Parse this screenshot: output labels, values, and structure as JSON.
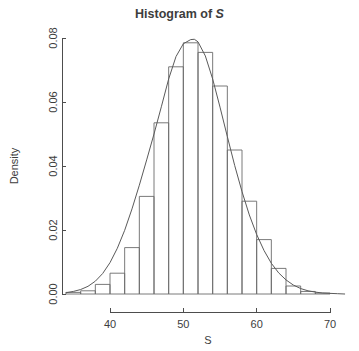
{
  "chart_data": {
    "type": "bar",
    "title": "Histogram of S",
    "title_prefix": "Histogram of ",
    "title_variable": "S",
    "xlabel": "S",
    "ylabel": "Density",
    "xlim": [
      34,
      72
    ],
    "ylim": [
      0,
      0.08
    ],
    "xticks": [
      40,
      50,
      60,
      70
    ],
    "xtick_labels": [
      "40",
      "50",
      "60",
      "70"
    ],
    "yticks": [
      0.0,
      0.02,
      0.04,
      0.06,
      0.08
    ],
    "ytick_labels": [
      "0.00",
      "0.02",
      "0.04",
      "0.06",
      "0.08"
    ],
    "grid": false,
    "legend": null,
    "bin_width": 2,
    "bin_edges": [
      34,
      36,
      38,
      40,
      42,
      44,
      46,
      48,
      50,
      52,
      54,
      56,
      58,
      60,
      62,
      64,
      66,
      68,
      70
    ],
    "categories": [
      "34-36",
      "36-38",
      "38-40",
      "40-42",
      "42-44",
      "44-46",
      "46-48",
      "48-50",
      "50-52",
      "52-54",
      "54-56",
      "56-58",
      "58-60",
      "60-62",
      "62-64",
      "64-66",
      "66-68",
      "68-70"
    ],
    "values": [
      0.0005,
      0.001,
      0.003,
      0.0065,
      0.0145,
      0.0305,
      0.0535,
      0.071,
      0.0785,
      0.0755,
      0.065,
      0.045,
      0.029,
      0.017,
      0.008,
      0.0025,
      0.0008,
      0.0003
    ],
    "overlay_curve": {
      "name": "density",
      "x": [
        34.0,
        35.0,
        36.0,
        37.0,
        38.0,
        39.0,
        40.0,
        41.0,
        42.0,
        43.0,
        44.0,
        45.0,
        46.0,
        47.0,
        48.0,
        49.0,
        50.0,
        51.0,
        51.5,
        52.0,
        53.0,
        54.0,
        55.0,
        56.0,
        57.0,
        58.0,
        59.0,
        60.0,
        61.0,
        62.0,
        63.0,
        64.0,
        65.0,
        66.0,
        67.0,
        68.0,
        69.0,
        70.0,
        71.0,
        72.0
      ],
      "y": [
        0.0004,
        0.0008,
        0.0014,
        0.0024,
        0.004,
        0.0064,
        0.0098,
        0.0143,
        0.0199,
        0.0266,
        0.034,
        0.0419,
        0.05,
        0.0585,
        0.0672,
        0.0742,
        0.0782,
        0.0795,
        0.0796,
        0.0788,
        0.0744,
        0.0672,
        0.0584,
        0.0492,
        0.0402,
        0.032,
        0.0247,
        0.0186,
        0.0136,
        0.0096,
        0.0066,
        0.0044,
        0.0028,
        0.0017,
        0.001,
        0.0006,
        0.0003,
        0.0002,
        0.0001,
        0.0
      ]
    },
    "colors": {
      "axis": "#4d4d4d",
      "bar_stroke": "#6b6b6b",
      "curve": "#5a5a5a",
      "background": "#ffffff",
      "text": "#3d3d3d"
    }
  }
}
